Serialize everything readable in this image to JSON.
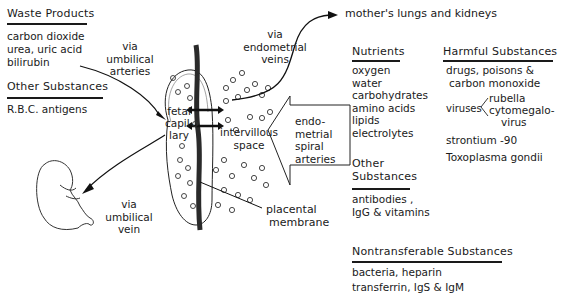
{
  "waste_products": {
    "heading": "Waste Products",
    "items": [
      "carbon dioxide",
      "urea, uric acid",
      "bilirubin"
    ]
  },
  "other_substances_left": {
    "heading": "Other Substances",
    "items": [
      "R.B.C. antigens"
    ]
  },
  "labels": {
    "via_umbilical_arteries": [
      "via",
      "umbilical",
      "arteries"
    ],
    "via_umbilical_vein": [
      "via",
      "umbilical",
      "vein"
    ],
    "via_endometrial_veins": [
      "via",
      "endometrial",
      "veins"
    ],
    "mothers_lungs": "mother's lungs and kidneys",
    "fetal_capillary": [
      "fetal",
      "capil-",
      "lary"
    ],
    "intervillous_space": [
      "intervillous",
      "space"
    ],
    "endometrial_spiral_arteries": [
      "endo-",
      "metrial",
      "spiral",
      "arteries"
    ],
    "placental_membrane": [
      "placental",
      "membrane"
    ]
  },
  "nutrients": {
    "heading": "Nutrients",
    "items": [
      "oxygen",
      "water",
      "carbohydrates",
      "amino acids",
      "lipids",
      "electrolytes"
    ]
  },
  "other_substances_mid": {
    "heading": [
      "Other",
      "Substances"
    ],
    "items": [
      "antibodies ,",
      "IgG & vitamins"
    ]
  },
  "harmful_substances": {
    "heading": "Harmful Substances",
    "items": [
      "drugs, poisons &",
      "carbon monoxide"
    ],
    "viruses_label": "viruses",
    "viruses": [
      "rubella",
      "cytomegalo-",
      "virus"
    ],
    "more_items": [
      "strontium -90",
      "Toxoplasma gondii"
    ]
  },
  "nontransferable": {
    "heading": "Nontransferable Substances",
    "items": [
      "bacteria, heparin",
      "transferrin, IgS & IgM"
    ]
  }
}
